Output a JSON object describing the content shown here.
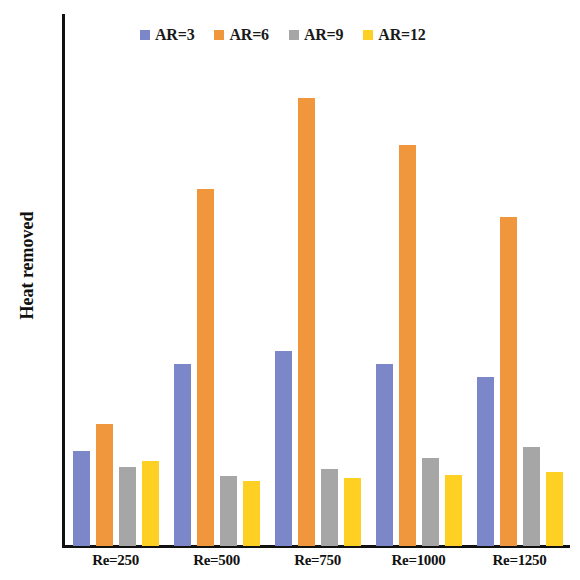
{
  "chart_data": {
    "type": "bar",
    "title": "",
    "xlabel": "",
    "ylabel": "Heat removed",
    "ylim": [
      0,
      70
    ],
    "yticks": [
      0,
      10,
      20,
      30,
      40,
      50,
      60,
      70
    ],
    "grid": false,
    "legend_position": "top",
    "categories": [
      "Re=250",
      "Re=500",
      "Re=750",
      "Re=1000",
      "Re=1250"
    ],
    "series": [
      {
        "name": "AR=3",
        "color": "#7b87c8",
        "values": [
          12.5,
          24.0,
          25.6,
          24.0,
          22.3
        ]
      },
      {
        "name": "AR=6",
        "color": "#f0963c",
        "values": [
          16.0,
          47.0,
          59.0,
          52.7,
          43.3
        ]
      },
      {
        "name": "AR=9",
        "color": "#a6a6a6",
        "values": [
          10.4,
          9.2,
          10.1,
          11.6,
          13.0
        ]
      },
      {
        "name": "AR=12",
        "color": "#ffd024",
        "values": [
          11.2,
          8.6,
          9.0,
          9.3,
          9.8
        ]
      }
    ]
  },
  "axis": {
    "y_tick_labels": [
      "70",
      "60",
      "50",
      "40",
      "30",
      "20",
      "10",
      "0"
    ],
    "y_title": "Heat removed"
  }
}
